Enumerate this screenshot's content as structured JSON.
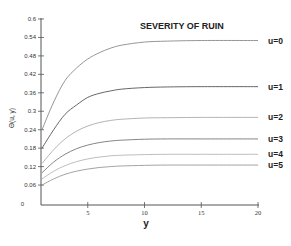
{
  "chart_data": {
    "type": "line",
    "title": "SEVERITY OF RUIN",
    "xlabel": "y",
    "ylabel": "Θ(u, y)",
    "xlim": [
      1,
      20
    ],
    "ylim": [
      0,
      0.6
    ],
    "grid": false,
    "legend_position": "inline-right",
    "x_ticks": [
      "5",
      "10",
      "15",
      "20"
    ],
    "x_tick_values": [
      5,
      10,
      15,
      20
    ],
    "y_ticks": [
      "0",
      "0.06",
      "0.12",
      "0.18",
      "0.24",
      "0.3",
      "0.36",
      "0.42",
      "0.48",
      "0.54",
      "0.6"
    ],
    "y_tick_values": [
      0,
      0.06,
      0.12,
      0.18,
      0.24,
      0.3,
      0.36,
      0.42,
      0.48,
      0.54,
      0.6
    ],
    "x": [
      1,
      2,
      3,
      4,
      5,
      6,
      7,
      8,
      10,
      12,
      15,
      20
    ],
    "series": [
      {
        "name": "u=0",
        "color": "#8a8a8a",
        "values": [
          0.24,
          0.33,
          0.4,
          0.44,
          0.47,
          0.49,
          0.505,
          0.515,
          0.525,
          0.528,
          0.53,
          0.53
        ]
      },
      {
        "name": "u=1",
        "color": "#555555",
        "values": [
          0.18,
          0.24,
          0.29,
          0.32,
          0.345,
          0.358,
          0.366,
          0.372,
          0.377,
          0.379,
          0.38,
          0.38
        ]
      },
      {
        "name": "u=2",
        "color": "#aaaaaa",
        "values": [
          0.13,
          0.175,
          0.21,
          0.235,
          0.252,
          0.263,
          0.27,
          0.274,
          0.278,
          0.279,
          0.28,
          0.28
        ]
      },
      {
        "name": "u=3",
        "color": "#777777",
        "values": [
          0.1,
          0.135,
          0.16,
          0.178,
          0.19,
          0.198,
          0.203,
          0.206,
          0.209,
          0.21,
          0.21,
          0.21
        ]
      },
      {
        "name": "u=4",
        "color": "#b5b5b5",
        "values": [
          0.08,
          0.105,
          0.123,
          0.136,
          0.145,
          0.151,
          0.155,
          0.157,
          0.159,
          0.16,
          0.16,
          0.16
        ]
      },
      {
        "name": "u=5",
        "color": "#999999",
        "values": [
          0.06,
          0.08,
          0.095,
          0.105,
          0.112,
          0.117,
          0.12,
          0.122,
          0.124,
          0.125,
          0.125,
          0.125
        ]
      }
    ]
  }
}
